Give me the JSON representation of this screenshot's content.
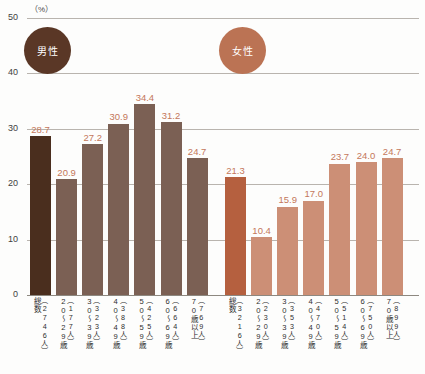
{
  "chart_data": {
    "type": "bar",
    "title": "",
    "xlabel": "",
    "ylabel": "(%)",
    "ylim": [
      0,
      50
    ],
    "yticks": [
      0,
      10,
      20,
      30,
      40,
      50
    ],
    "grid": true,
    "legend_position": "inside-top-left-and-center",
    "groups": [
      {
        "name": "男性",
        "legend_label": "男性",
        "color": "#7b6054",
        "highlight_color": "#4a2e1e",
        "categories": [
          "総数",
          "20～29歳",
          "30～39歳",
          "40～49歳",
          "50～59歳",
          "60～69歳",
          "70歳以上"
        ],
        "counts": [
          "（2746人）",
          "（177人）",
          "（323人）",
          "（388人）",
          "（425人）",
          "（664人）",
          "（769人）"
        ],
        "values": [
          28.7,
          20.9,
          27.2,
          30.9,
          34.4,
          31.2,
          24.7
        ]
      },
      {
        "name": "女性",
        "legend_label": "女性",
        "color": "#cc8f76",
        "highlight_color": "#b5603f",
        "categories": [
          "総数",
          "20～29歳",
          "30～39歳",
          "40～49歳",
          "50～59歳",
          "60～69歳",
          "70歳以上"
        ],
        "counts": [
          "（3216人）",
          "（230人）",
          "（353人）",
          "（470人）",
          "（514人）",
          "（750人）",
          "（899人）"
        ],
        "values": [
          21.3,
          10.4,
          15.9,
          17.0,
          23.7,
          24.0,
          24.7
        ]
      }
    ],
    "value_label_color": "#c4775a"
  },
  "axis": {
    "unit": "（%）",
    "tick_50": "50",
    "tick_40": "40",
    "tick_30": "30",
    "tick_20": "20",
    "tick_10": "10",
    "tick_0": "0"
  }
}
